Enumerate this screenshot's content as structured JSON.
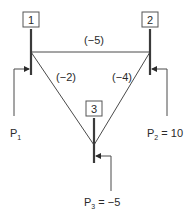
{
  "diagram": {
    "type": "truss-node-diagram",
    "nodes": [
      {
        "id": "1",
        "label": "1",
        "x": 31,
        "y": 52
      },
      {
        "id": "2",
        "label": "2",
        "x": 150,
        "y": 52
      },
      {
        "id": "3",
        "label": "3",
        "x": 94,
        "y": 145
      }
    ],
    "members": [
      {
        "from": "1",
        "to": "2",
        "label": "(−5)"
      },
      {
        "from": "1",
        "to": "3",
        "label": "(−2)"
      },
      {
        "from": "2",
        "to": "3",
        "label": "(−4)"
      }
    ],
    "loads": [
      {
        "node": "1",
        "symbol": "P",
        "subscript": "1",
        "value_text": ""
      },
      {
        "node": "2",
        "symbol": "P",
        "subscript": "2",
        "value_text": " = 10"
      },
      {
        "node": "3",
        "symbol": "P",
        "subscript": "3",
        "value_text": " = −5"
      }
    ],
    "colors": {
      "line": "#4a4a4a",
      "text": "#2a2a2a",
      "box_border": "#555555"
    }
  }
}
